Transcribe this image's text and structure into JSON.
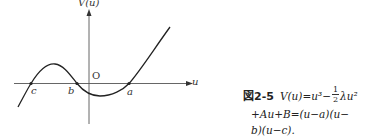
{
  "figure": {
    "y_axis_label": "V(u)",
    "origin_label": "O",
    "x_axis_label": "u",
    "roots": [
      {
        "label": "c",
        "x": 31
      },
      {
        "label": "b",
        "x": 77
      },
      {
        "label": "a",
        "x": 129
      }
    ],
    "curve": "cubic V(u) with roots c < b < a, local max between c and b, local min between b and a"
  },
  "caption": {
    "figure_number": "図2-5",
    "line1_prefix": "V(u)=u³−",
    "fraction_num": "1",
    "fraction_den": "2",
    "line1_suffix": "λu²",
    "line2": "+Au+B=(u−a)(u−",
    "line3": "b)(u−c)."
  }
}
